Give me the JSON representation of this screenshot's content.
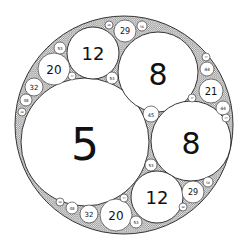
{
  "diagram": {
    "type": "apollonian-gasket",
    "outer": {
      "cx": 124,
      "cy": 125,
      "r": 109,
      "curvature": -2
    },
    "colors": {
      "stroke": "#222222",
      "fill": "#ffffff",
      "gap_fill": "#8a8a8a",
      "text": "#111111"
    },
    "circles": [
      {
        "label": "5",
        "cx": 85,
        "cy": 142,
        "r": 64,
        "fs": 44
      },
      {
        "label": "8",
        "cx": 158,
        "cy": 72,
        "r": 40,
        "fs": 30
      },
      {
        "label": "8",
        "cx": 191,
        "cy": 141,
        "r": 40,
        "fs": 30
      },
      {
        "label": "12",
        "cx": 93,
        "cy": 53,
        "r": 26,
        "fs": 18
      },
      {
        "label": "12",
        "cx": 157,
        "cy": 197,
        "r": 26,
        "fs": 18
      },
      {
        "label": "20",
        "cx": 54,
        "cy": 69,
        "r": 16,
        "fs": 12
      },
      {
        "label": "20",
        "cx": 116,
        "cy": 215,
        "r": 16,
        "fs": 12
      },
      {
        "label": "21",
        "cx": 211,
        "cy": 91,
        "r": 12,
        "fs": 10
      },
      {
        "label": "29",
        "cx": 125,
        "cy": 31,
        "r": 11,
        "fs": 8
      },
      {
        "label": "29",
        "cx": 193,
        "cy": 192,
        "r": 11,
        "fs": 8
      },
      {
        "label": "32",
        "cx": 34,
        "cy": 87,
        "r": 9,
        "fs": 7
      },
      {
        "label": "32",
        "cx": 89,
        "cy": 214,
        "r": 9,
        "fs": 7
      },
      {
        "label": "45",
        "cx": 151,
        "cy": 114,
        "r": 8,
        "fs": 5
      },
      {
        "label": "44",
        "cx": 207,
        "cy": 69,
        "r": 7,
        "fs": 4.5
      },
      {
        "label": "44",
        "cx": 223,
        "cy": 108,
        "r": 7,
        "fs": 4.5
      },
      {
        "label": "53",
        "cx": 60,
        "cy": 48,
        "r": 6,
        "fs": 4
      },
      {
        "label": "53",
        "cx": 112,
        "cy": 78,
        "r": 6,
        "fs": 4
      },
      {
        "label": "53",
        "cx": 151,
        "cy": 165,
        "r": 6,
        "fs": 4
      },
      {
        "label": "53",
        "cx": 136,
        "cy": 222,
        "r": 6,
        "fs": 4
      },
      {
        "label": "48",
        "cx": 26,
        "cy": 100,
        "r": 6,
        "fs": 4
      },
      {
        "label": "48",
        "cx": 72,
        "cy": 208,
        "r": 6,
        "fs": 4
      },
      {
        "label": "56",
        "cx": 142,
        "cy": 26,
        "r": 5,
        "fs": 3
      },
      {
        "label": "56",
        "cx": 208,
        "cy": 182,
        "r": 5,
        "fs": 3
      },
      {
        "label": "68",
        "cx": 109,
        "cy": 25,
        "r": 4,
        "fs": 2.5
      },
      {
        "label": "68",
        "cx": 183,
        "cy": 207,
        "r": 4,
        "fs": 2.5
      },
      {
        "label": "77",
        "cx": 206,
        "cy": 57,
        "r": 4,
        "fs": 2.5
      },
      {
        "label": "77",
        "cx": 72,
        "cy": 76,
        "r": 4,
        "fs": 2.5
      },
      {
        "label": "77",
        "cx": 192,
        "cy": 98,
        "r": 4,
        "fs": 2.5
      },
      {
        "label": "77",
        "cx": 226,
        "cy": 118,
        "r": 4,
        "fs": 2.5
      },
      {
        "label": "77",
        "cx": 124,
        "cy": 198,
        "r": 4,
        "fs": 2.5
      },
      {
        "label": "68",
        "cx": 22,
        "cy": 112,
        "r": 4,
        "fs": 2.5
      },
      {
        "label": "68",
        "cx": 60,
        "cy": 202,
        "r": 4,
        "fs": 2.5
      }
    ]
  }
}
